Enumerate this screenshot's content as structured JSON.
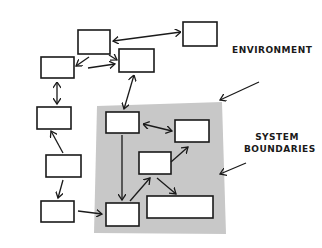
{
  "diagram": {
    "labels": {
      "environment": "ENVIRONMENT",
      "system_line1": "SYSTEM",
      "system_line2": "BOUNDARIES"
    },
    "colors": {
      "boundary_fill": "#c8c8c8",
      "stroke": "#1a1a1a",
      "box_fill": "#ffffff"
    },
    "nodes": [
      {
        "id": "top-center",
        "x": 78,
        "y": 30,
        "w": 32,
        "h": 24
      },
      {
        "id": "top-right",
        "x": 183,
        "y": 22,
        "w": 34,
        "h": 24
      },
      {
        "id": "upper-left",
        "x": 41,
        "y": 57,
        "w": 33,
        "h": 21
      },
      {
        "id": "upper-mid",
        "x": 119,
        "y": 49,
        "w": 35,
        "h": 23
      },
      {
        "id": "mid-left",
        "x": 37,
        "y": 107,
        "w": 34,
        "h": 22
      },
      {
        "id": "sys-top",
        "x": 106,
        "y": 112,
        "w": 33,
        "h": 21
      },
      {
        "id": "sys-right",
        "x": 175,
        "y": 120,
        "w": 34,
        "h": 22
      },
      {
        "id": "sys-center",
        "x": 139,
        "y": 152,
        "w": 32,
        "h": 22
      },
      {
        "id": "left-lower",
        "x": 46,
        "y": 155,
        "w": 35,
        "h": 22
      },
      {
        "id": "bottom-left",
        "x": 41,
        "y": 201,
        "w": 33,
        "h": 21
      },
      {
        "id": "sys-bottom",
        "x": 106,
        "y": 203,
        "w": 33,
        "h": 23
      },
      {
        "id": "sys-wide",
        "x": 147,
        "y": 196,
        "w": 66,
        "h": 22
      }
    ]
  }
}
